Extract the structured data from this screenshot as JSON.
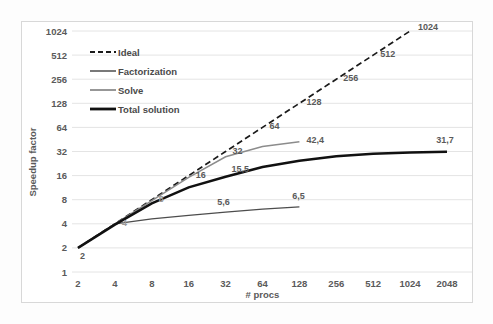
{
  "chart_data": {
    "type": "line",
    "title": "",
    "xlabel": "# procs",
    "ylabel": "Speedup factor",
    "xscale": "log2",
    "yscale": "log2",
    "xlim": [
      2,
      2048
    ],
    "ylim": [
      1,
      1024
    ],
    "grid": "horizontal",
    "legend_position": "upper-left-inside",
    "x_tick_labels": [
      "2",
      "4",
      "8",
      "16",
      "32",
      "64",
      "128",
      "256",
      "512",
      "1024",
      "2048"
    ],
    "y_tick_labels": [
      "1",
      "2",
      "4",
      "8",
      "16",
      "32",
      "64",
      "128",
      "256",
      "512",
      "1024"
    ],
    "x": [
      2,
      4,
      8,
      16,
      32,
      64,
      128,
      256,
      512,
      1024,
      2048
    ],
    "series": [
      {
        "name": "Ideal",
        "style": "dashed",
        "color": "#1a1a1a",
        "x": [
          2,
          4,
          8,
          16,
          32,
          64,
          128,
          256,
          512,
          1024
        ],
        "values": [
          2,
          4,
          8,
          16,
          32,
          64,
          128,
          256,
          512,
          1024
        ],
        "point_labels": [
          "2",
          "4",
          "8",
          "16",
          "32",
          "64",
          "128",
          "256",
          "512",
          "1024"
        ]
      },
      {
        "name": "Factorization",
        "style": "solid-thin",
        "color": "#4d4d4d",
        "x": [
          2,
          4,
          8,
          16,
          32,
          64,
          128
        ],
        "values": [
          2,
          4,
          4.6,
          5.1,
          5.6,
          6.1,
          6.5
        ],
        "point_labels": [
          "",
          "",
          "",
          "",
          "5,6",
          "",
          "6,5"
        ]
      },
      {
        "name": "Solve",
        "style": "solid-gray",
        "color": "#8c8c8c",
        "x": [
          2,
          4,
          8,
          16,
          32,
          64,
          128
        ],
        "values": [
          2,
          4,
          7.8,
          15.2,
          27.5,
          37.0,
          42.4
        ],
        "point_labels": [
          "",
          "",
          "",
          "",
          "",
          "",
          "42,4"
        ]
      },
      {
        "name": "Total solution",
        "style": "solid-thick",
        "color": "#111111",
        "x": [
          2,
          4,
          8,
          16,
          32,
          64,
          128,
          256,
          512,
          1024,
          2048
        ],
        "values": [
          2,
          3.9,
          7.2,
          11.4,
          15.5,
          20.5,
          24.5,
          28.0,
          30.0,
          31.2,
          31.7
        ],
        "point_labels": [
          "2",
          "",
          "",
          "",
          "15,5",
          "",
          "",
          "",
          "",
          "",
          "31,7"
        ]
      }
    ],
    "annotations": [
      {
        "text": "2",
        "series": "start",
        "x": 2,
        "y": 2
      },
      {
        "text": "4",
        "series": "Ideal",
        "x": 4,
        "y": 4
      },
      {
        "text": "8",
        "series": "Ideal",
        "x": 8,
        "y": 8
      },
      {
        "text": "16",
        "series": "Ideal",
        "x": 16,
        "y": 16
      },
      {
        "text": "32",
        "series": "Ideal",
        "x": 32,
        "y": 32
      },
      {
        "text": "64",
        "series": "Ideal",
        "x": 64,
        "y": 64
      },
      {
        "text": "128",
        "series": "Ideal",
        "x": 128,
        "y": 128
      },
      {
        "text": "256",
        "series": "Ideal",
        "x": 256,
        "y": 256
      },
      {
        "text": "512",
        "series": "Ideal",
        "x": 512,
        "y": 512
      },
      {
        "text": "1024",
        "series": "Ideal",
        "x": 1024,
        "y": 1024
      },
      {
        "text": "5,6",
        "series": "Factorization",
        "x": 32,
        "y": 5.6
      },
      {
        "text": "6,5",
        "series": "Factorization",
        "x": 128,
        "y": 6.5
      },
      {
        "text": "42,4",
        "series": "Solve",
        "x": 128,
        "y": 42.4
      },
      {
        "text": "15,5",
        "series": "Total solution",
        "x": 32,
        "y": 15.5
      },
      {
        "text": "31,7",
        "series": "Total solution",
        "x": 2048,
        "y": 31.7
      }
    ]
  },
  "legend": {
    "items": [
      {
        "label": "Ideal"
      },
      {
        "label": "Factorization"
      },
      {
        "label": "Solve"
      },
      {
        "label": "Total solution"
      }
    ]
  },
  "colors": {
    "ideal": "#1a1a1a",
    "factorization": "#4d4d4d",
    "solve": "#8c8c8c",
    "total": "#111111",
    "grid": "#e4e4e4",
    "frame": "#d8d8d8",
    "text": "#5a5a5a",
    "background": "#ffffff"
  }
}
